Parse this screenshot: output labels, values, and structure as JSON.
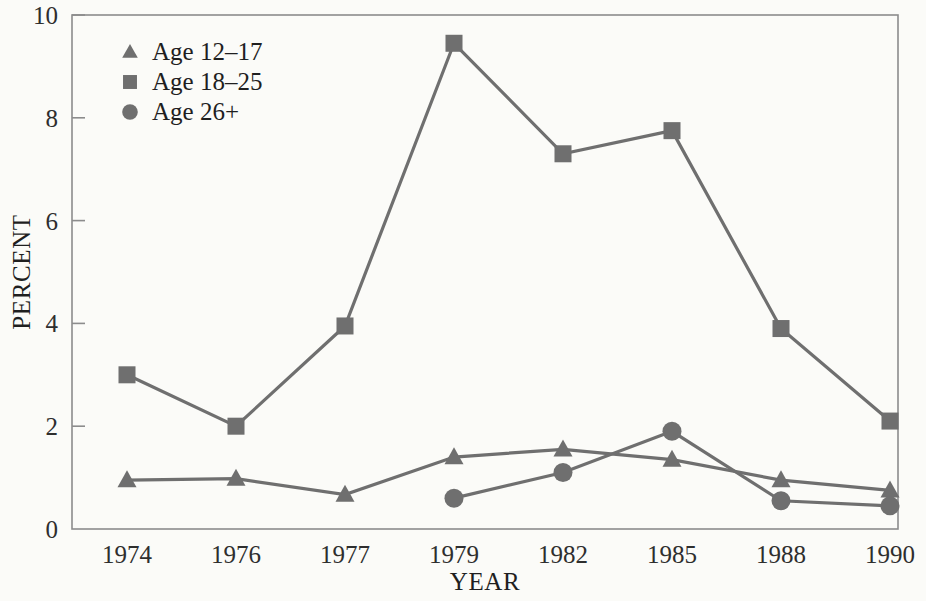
{
  "chart_data": {
    "type": "line",
    "title": "",
    "subtitle": "",
    "xlabel": "YEAR",
    "ylabel": "PERCENT",
    "categories": [
      "1974",
      "1976",
      "1977",
      "1979",
      "1982",
      "1985",
      "1988",
      "1990"
    ],
    "xtick_labels": [
      "1974",
      "1976",
      "1977",
      "1979",
      "1982",
      "1985",
      "1988",
      "1990"
    ],
    "ytick_labels": [
      "0",
      "2",
      "4",
      "6",
      "8",
      "10"
    ],
    "yticks": [
      0,
      2,
      4,
      6,
      8,
      10
    ],
    "ylim": [
      0,
      10
    ],
    "grid": false,
    "legend_position": "upper-left-inside",
    "category_spacing": "even",
    "series": [
      {
        "name": "Age 12–17",
        "marker": "triangle",
        "color": "#6f6f6f",
        "line_color": "#6f6f6f",
        "values": [
          0.95,
          0.98,
          0.67,
          1.4,
          1.55,
          1.35,
          0.95,
          0.75
        ]
      },
      {
        "name": "Age 18–25",
        "marker": "square",
        "color": "#6f6f6f",
        "line_color": "#6f6f6f",
        "values": [
          3.0,
          2.0,
          3.95,
          9.45,
          7.3,
          7.75,
          3.9,
          2.1
        ]
      },
      {
        "name": "Age 26+",
        "marker": "circle",
        "color": "#6f6f6f",
        "line_color": "#6f6f6f",
        "values": [
          null,
          null,
          null,
          0.6,
          1.1,
          1.9,
          0.55,
          0.45
        ]
      }
    ],
    "legend": [
      {
        "label": "Age 12–17",
        "marker": "triangle"
      },
      {
        "label": "Age 18–25",
        "marker": "square"
      },
      {
        "label": "Age 26+",
        "marker": "circle"
      }
    ],
    "colors": {
      "background": "#fbfbf8",
      "axis": "#8c8c8c",
      "series_gray": "#6f6f6f",
      "text": "#1f1f1f"
    }
  }
}
